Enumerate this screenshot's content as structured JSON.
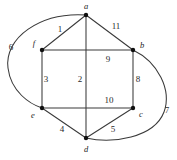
{
  "figure": {
    "kind": "planar-graph-diagram",
    "background_color": "#ffffff",
    "stroke_color": "#3a3a3a",
    "text_color": "#2a2a2a",
    "width": 177,
    "height": 160
  },
  "vertices": [
    {
      "id": "a",
      "label": "a",
      "x": 86,
      "y": 15,
      "label_x": 86,
      "label_y": 8
    },
    {
      "id": "f",
      "label": "f",
      "x": 42,
      "y": 50,
      "label_x": 35,
      "label_y": 45
    },
    {
      "id": "b",
      "label": "b",
      "x": 133,
      "y": 50,
      "label_x": 141,
      "label_y": 47
    },
    {
      "id": "e",
      "label": "e",
      "x": 42,
      "y": 108,
      "label_x": 34,
      "label_y": 116
    },
    {
      "id": "c",
      "label": "c",
      "x": 133,
      "y": 108,
      "label_x": 140,
      "label_y": 116
    },
    {
      "id": "d",
      "label": "d",
      "x": 86,
      "y": 138,
      "label_x": 86,
      "label_y": 150
    }
  ],
  "edges": [
    {
      "id": "e1",
      "label": "1",
      "from": "a",
      "to": "f",
      "shape": "line",
      "label_x": 60,
      "label_y": 31
    },
    {
      "id": "e11",
      "label": "11",
      "from": "a",
      "to": "b",
      "shape": "line",
      "label_x": 115,
      "label_y": 28
    },
    {
      "id": "e6",
      "label": "6",
      "from": "f",
      "to": "e",
      "shape": "curve",
      "label_x": 11,
      "label_y": 49
    },
    {
      "id": "e9",
      "label": "9",
      "from": "f",
      "to": "b",
      "shape": "line",
      "label_x": 108,
      "label_y": 61
    },
    {
      "id": "e3",
      "label": "3",
      "from": "f",
      "to": "e",
      "shape": "line",
      "label_x": 45,
      "label_y": 81
    },
    {
      "id": "e2",
      "label": "2",
      "from": "a",
      "to": "d",
      "shape": "line",
      "label_x": 80,
      "label_y": 81
    },
    {
      "id": "e8",
      "label": "8",
      "from": "b",
      "to": "c",
      "shape": "line",
      "label_x": 137,
      "label_y": 81
    },
    {
      "id": "e10",
      "label": "10",
      "from": "e",
      "to": "c",
      "shape": "line",
      "label_x": 108,
      "label_y": 102
    },
    {
      "id": "e4",
      "label": "4",
      "from": "e",
      "to": "d",
      "shape": "line",
      "label_x": 62,
      "label_y": 131
    },
    {
      "id": "e5",
      "label": "5",
      "from": "c",
      "to": "d",
      "shape": "line",
      "label_x": 112,
      "label_y": 131
    },
    {
      "id": "e7",
      "label": "7",
      "from": "b",
      "to": "d",
      "shape": "curve",
      "label_x": 166,
      "label_y": 112
    }
  ],
  "curve_paths": {
    "e6": "M 86 15 C 40 12 4 38 8 68 C 11 92 30 104 42 108",
    "e7": "M 133 50 C 158 62 172 90 164 112 C 154 138 112 144 86 138"
  },
  "geometry_paths": {
    "a_f": "M 86 15 L 42 50",
    "a_b": "M 86 15 L 133 50",
    "f_b": "M 42 50 L 133 50",
    "f_e": "M 42 50 L 42 108",
    "a_d": "M 86 15 L 86 138",
    "b_c": "M 133 50 L 133 108",
    "e_c": "M 42 108 L 133 108",
    "e_d": "M 42 108 L 86 138",
    "c_d": "M 133 108 L 86 138"
  }
}
